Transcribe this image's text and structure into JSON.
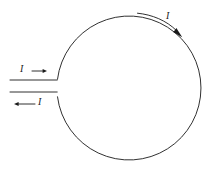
{
  "figure": {
    "background_color": "#ffffff",
    "line_color": "#1a1a1a",
    "width": 203,
    "height": 173
  },
  "labels": {
    "inflow_current": "I",
    "outflow_current": "I",
    "loop_current": "I"
  },
  "icons": {
    "inflow_arrow": "arrow-right-icon",
    "outflow_arrow": "arrow-left-icon",
    "loop_arrow": "curved-arrow-clockwise-icon"
  },
  "geometry": {
    "circle": {
      "center_x": 123,
      "center_y": 88,
      "radius": 72,
      "gap_top_y": 79,
      "gap_bottom_y": 92
    },
    "lead_top": {
      "x1": 10,
      "y1": 80,
      "x2": 57,
      "y2": 80
    },
    "lead_bottom": {
      "x1": 10,
      "y1": 92,
      "x2": 57,
      "y2": 92
    },
    "inflow_arrow": {
      "x1": 32,
      "y1": 71,
      "x2": 46,
      "y2": 71
    },
    "outflow_arrow": {
      "x1": 35,
      "y1": 104,
      "x2": 14,
      "y2": 104
    },
    "loop_arrow": {
      "start_x": 137,
      "start_y": 13,
      "end_x": 182,
      "end_y": 38
    }
  }
}
